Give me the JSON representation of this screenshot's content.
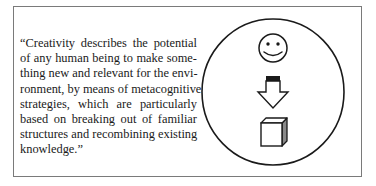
{
  "quote": {
    "lines": [
      "“Creativity describes the potential",
      "of any human being to make some-",
      "thing new and relevant for the envi-",
      "ronment, by means of metacognitive",
      "strategies, which are particularly",
      "based on breaking out of familiar",
      "structures and recombining existing",
      "knowledge.”"
    ]
  },
  "diagram": {
    "container": "circle",
    "icons": [
      "smiley-face-icon",
      "down-arrow-icon",
      "cube-icon"
    ],
    "stroke_color": "#1a1a1a",
    "frame_color": "#7a7a7a",
    "cube_side_shade": "#8a8a8a"
  }
}
